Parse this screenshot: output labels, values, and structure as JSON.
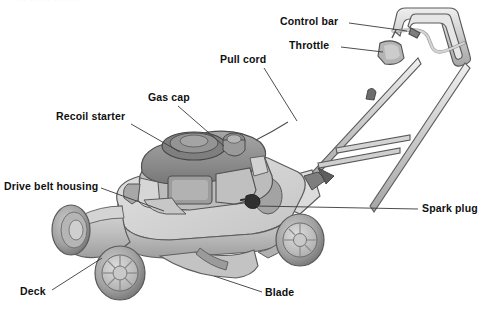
{
  "page": {
    "width": 491,
    "height": 310,
    "background": "#ffffff",
    "header_fragment": "··· ······ ·········"
  },
  "colors": {
    "label_text": "#101010",
    "leader_line": "#3a3a3a",
    "deck_light": "#d0d0d0",
    "deck_mid": "#b8b8b8",
    "deck_dark": "#9a9a9a",
    "engine_dark": "#8e8e8e",
    "engine_mid": "#a8a8a8",
    "tire_dark": "#8a8a8a",
    "tire_light": "#c2c2c2",
    "handle_light": "#d8d8d8",
    "outline": "#4a4a4a"
  },
  "labels": [
    {
      "id": "control-bar",
      "text": "Control bar",
      "x": 280,
      "y": 16
    },
    {
      "id": "throttle",
      "text": "Throttle",
      "x": 289,
      "y": 40
    },
    {
      "id": "pull-cord",
      "text": "Pull cord",
      "x": 220,
      "y": 54
    },
    {
      "id": "gas-cap",
      "text": "Gas cap",
      "x": 148,
      "y": 92
    },
    {
      "id": "recoil-starter",
      "text": "Recoil starter",
      "x": 56,
      "y": 111
    },
    {
      "id": "drive-belt-housing",
      "text": "Drive belt housing",
      "x": 4,
      "y": 181
    },
    {
      "id": "spark-plug",
      "text": "Spark plug",
      "x": 422,
      "y": 203
    },
    {
      "id": "deck",
      "text": "Deck",
      "x": 20,
      "y": 286
    },
    {
      "id": "blade",
      "text": "Blade",
      "x": 265,
      "y": 287
    }
  ],
  "leader_lines": [
    {
      "id": "control-bar-leader",
      "from": [
        349,
        23
      ],
      "to": [
        407,
        31
      ]
    },
    {
      "id": "throttle-leader",
      "from": [
        341,
        47
      ],
      "to": [
        383,
        52
      ]
    },
    {
      "id": "pull-cord-leader",
      "from": [
        264,
        68
      ],
      "to": [
        295,
        120
      ]
    },
    {
      "id": "gas-cap-leader",
      "from": [
        178,
        106
      ],
      "to": [
        222,
        148
      ]
    },
    {
      "id": "recoil-starter-leader",
      "from": [
        131,
        124
      ],
      "to": [
        178,
        152
      ]
    },
    {
      "id": "drive-belt-leader",
      "from": [
        101,
        188
      ],
      "to": [
        163,
        210
      ]
    },
    {
      "id": "spark-plug-leader",
      "from": [
        418,
        209
      ],
      "to": [
        258,
        209
      ]
    },
    {
      "id": "deck-leader",
      "from": [
        52,
        290
      ],
      "to": [
        100,
        260
      ]
    },
    {
      "id": "blade-leader",
      "from": [
        262,
        292
      ],
      "to": [
        215,
        277
      ]
    }
  ],
  "parts": {
    "engine": "engine-block",
    "recoil_housing": "recoil-starter-housing",
    "gas_cap": "gas-cap-knob",
    "deck": "mower-deck",
    "wheels": [
      "front-left-wheel",
      "front-right-wheel",
      "rear-left-wheel",
      "rear-right-wheel"
    ],
    "handle": "handle-bar-assembly",
    "control_bar": "control-bar-bail",
    "throttle": "throttle-lever",
    "spark_plug": "spark-plug-boot",
    "blade": "blade-under-deck"
  }
}
